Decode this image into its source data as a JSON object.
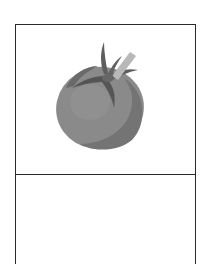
{
  "card": {
    "image": {
      "icon": "tomato-icon",
      "colors": {
        "body": "#8a8a8a",
        "body_shadow": "#6e6e6e",
        "body_highlight": "#9a9a9a",
        "leaves": "#5a5a5a",
        "stem_highlight": "#b8b8b8"
      }
    },
    "label": {
      "text": ""
    },
    "border_color": "#2a2a2a"
  }
}
